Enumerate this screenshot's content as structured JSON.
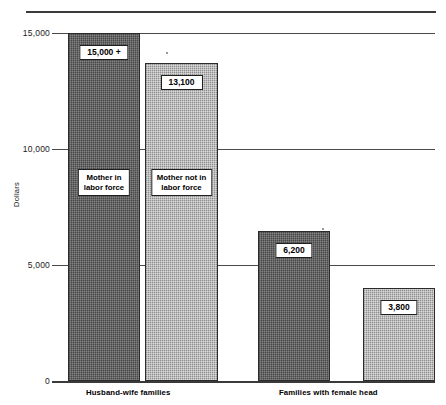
{
  "chart_data": {
    "type": "bar",
    "title": "",
    "subtitle": "",
    "xlabel": "",
    "ylabel": "Dollars",
    "ylim": [
      0,
      15000
    ],
    "yticks": [
      "0",
      "5,000",
      "10,000",
      "15,000"
    ],
    "grid": true,
    "legend_position": "in-bar callouts",
    "categories": [
      "Husband-wife families",
      "Families with female head"
    ],
    "series": [
      {
        "name": "Mother in labor force",
        "values": [
          15000,
          6200
        ],
        "value_labels": [
          "15,000 +",
          "6,200"
        ],
        "color": "#575757"
      },
      {
        "name": "Mother not in labor force",
        "values": [
          13100,
          3800
        ],
        "value_labels": [
          "13,100",
          "3,800"
        ],
        "color": "#ababab"
      }
    ],
    "annotations": [
      "15,000 +",
      "13,100",
      "6,200",
      "3,800",
      "Mother in labor force",
      "Mother not in labor force"
    ]
  },
  "axis": {
    "y_title": "Dollars",
    "ticks": {
      "t15000": "15,000",
      "t10000": "10,000",
      "t5000": "5,000",
      "t0": "0"
    }
  },
  "bars": {
    "hw_mother_in": {
      "value_label": "15,000 +",
      "series_label_line1": "Mother in",
      "series_label_line2": "labor force"
    },
    "hw_mother_not_in": {
      "value_label": "13,100",
      "series_label_line1": "Mother not in",
      "series_label_line2": "labor force"
    },
    "fh_mother_in": {
      "value_label": "6,200"
    },
    "fh_mother_not_in": {
      "value_label": "3,800"
    }
  },
  "categories": {
    "husband_wife": "Husband-wife families",
    "female_head": "Families with female head"
  },
  "colors": {
    "series_mother_in": "#575757",
    "series_mother_not_in": "#ababab",
    "axis": "#3a3a3a",
    "grid": "#4a4a4a",
    "text": "#000000"
  }
}
